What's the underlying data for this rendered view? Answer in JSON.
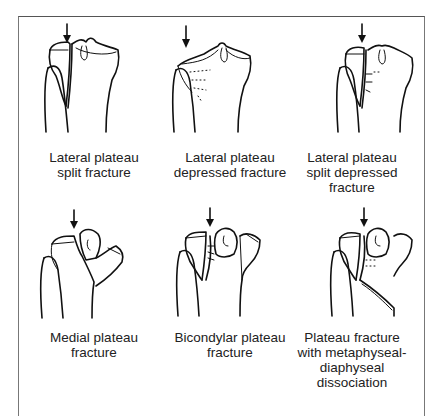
{
  "figure": {
    "panels": [
      {
        "id": "lateral-split",
        "caption_lines": [
          "Lateral plateau",
          "split fracture"
        ]
      },
      {
        "id": "lateral-depressed",
        "caption_lines": [
          "Lateral plateau",
          "depressed fracture"
        ]
      },
      {
        "id": "lateral-split-depressed",
        "caption_lines": [
          "Lateral plateau",
          "split depressed",
          "fracture"
        ]
      },
      {
        "id": "medial",
        "caption_lines": [
          "Medial plateau",
          "fracture"
        ]
      },
      {
        "id": "bicondylar",
        "caption_lines": [
          "Bicondylar plateau",
          "fracture"
        ]
      },
      {
        "id": "metaphyseal-diaphyseal",
        "caption_lines": [
          "Plateau fracture",
          "with metaphyseal-",
          "diaphyseal",
          "dissociation"
        ]
      }
    ],
    "arrow_icon": "down-arrow-icon",
    "colors": {
      "line": "#111111",
      "frame": "#666666",
      "text": "#222222",
      "background": "#ffffff"
    }
  }
}
